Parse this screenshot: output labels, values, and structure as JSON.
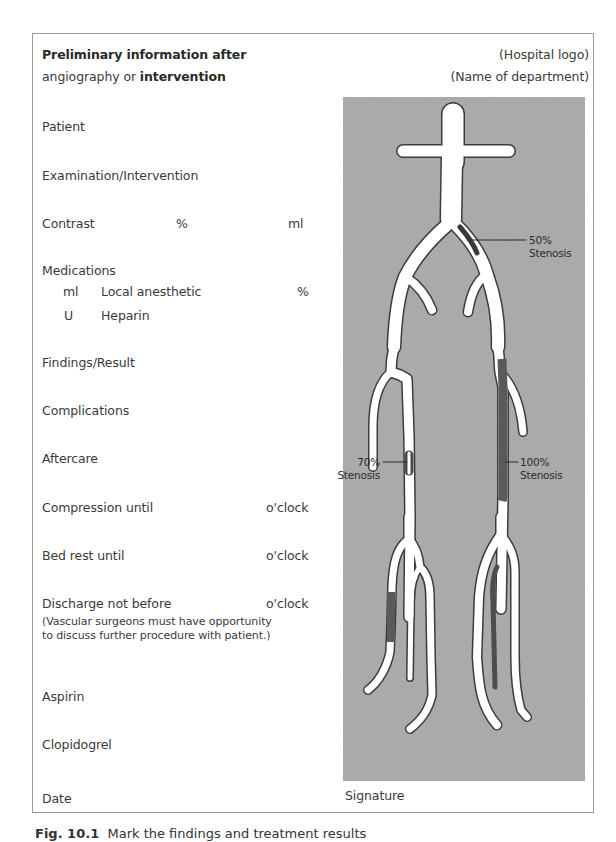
{
  "header": {
    "title_line1": "Preliminary information after",
    "title_line2_prefix": "angiography or ",
    "title_line2_bold": "intervention",
    "hospital_logo": "(Hospital logo)",
    "department": "(Name of department)"
  },
  "fields": {
    "patient": "Patient",
    "examination": "Examination/Intervention",
    "contrast": "Contrast",
    "contrast_unit_pct": "%",
    "contrast_unit_ml": "ml",
    "medications": "Medications",
    "med_local_unit": "ml",
    "med_local_label": "Local anesthetic",
    "med_local_pct": "%",
    "med_heparin_unit": "U",
    "med_heparin_label": "Heparin",
    "findings": "Findings/Result",
    "complications": "Complications",
    "aftercare": "Aftercare",
    "compression": "Compression until",
    "compression_unit": "o'clock",
    "bed_rest": "Bed rest until",
    "bed_rest_unit": "o'clock",
    "discharge": "Discharge not before",
    "discharge_unit": "o'clock",
    "discharge_note": "(Vascular surgeons must have opportunity to discuss further procedure with patient.)",
    "aspirin": "Aspirin",
    "clopidogrel": "Clopidogrel",
    "date": "Date",
    "signature": "Signature"
  },
  "diagram": {
    "background_color": "#a9a9a9",
    "vessel_color": "#ffffff",
    "lesion_color": "#585858",
    "annotations": [
      {
        "id": "stenosis-50",
        "pct": "50%",
        "label": "Stenosis"
      },
      {
        "id": "stenosis-70",
        "pct": "70%",
        "label": "Stenosis"
      },
      {
        "id": "stenosis-100",
        "pct": "100%",
        "label": "Stenosis"
      }
    ]
  },
  "caption": {
    "fig_label": "Fig. 10.1",
    "text": "Mark the findings and treatment results"
  }
}
